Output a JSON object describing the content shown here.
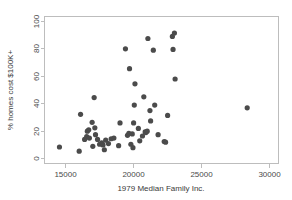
{
  "chart_data": {
    "type": "scatter",
    "title": "",
    "xlabel": "1979 Median Family Inc.",
    "ylabel": "% homes cost $100K+",
    "xlim": [
      13500,
      30700
    ],
    "ylim": [
      -4,
      103
    ],
    "xticks": [
      15000,
      20000,
      25000,
      30000
    ],
    "xtick_labels": [
      "15000",
      "20000",
      "25000",
      "30000"
    ],
    "yticks": [
      0,
      20,
      40,
      60,
      80,
      100
    ],
    "ytick_labels": [
      "0",
      "20",
      "40",
      "60",
      "80",
      "100"
    ],
    "grid": false,
    "legend": "none",
    "marker": "filled-circle",
    "marker_color": "#4b4b4b",
    "frame_color": "#bdbdbd",
    "points": [
      {
        "x": 14600,
        "y": 8.0
      },
      {
        "x": 16050,
        "y": 5.0
      },
      {
        "x": 16150,
        "y": 31.8
      },
      {
        "x": 16450,
        "y": 13.5
      },
      {
        "x": 16600,
        "y": 15.5
      },
      {
        "x": 16650,
        "y": 19.5
      },
      {
        "x": 16750,
        "y": 20.5
      },
      {
        "x": 16800,
        "y": 14.5
      },
      {
        "x": 17000,
        "y": 26.0
      },
      {
        "x": 17050,
        "y": 8.5
      },
      {
        "x": 17150,
        "y": 44.0
      },
      {
        "x": 17200,
        "y": 22.0
      },
      {
        "x": 17250,
        "y": 17.0
      },
      {
        "x": 17400,
        "y": 13.5
      },
      {
        "x": 17550,
        "y": 10.0
      },
      {
        "x": 17700,
        "y": 11.0
      },
      {
        "x": 17800,
        "y": 9.5
      },
      {
        "x": 17900,
        "y": 6.0
      },
      {
        "x": 18000,
        "y": 13.0
      },
      {
        "x": 18200,
        "y": 10.5
      },
      {
        "x": 18400,
        "y": 14.0
      },
      {
        "x": 18600,
        "y": 14.5
      },
      {
        "x": 18950,
        "y": 9.0
      },
      {
        "x": 19050,
        "y": 25.5
      },
      {
        "x": 19450,
        "y": 79.5
      },
      {
        "x": 19600,
        "y": 16.5
      },
      {
        "x": 19700,
        "y": 18.0
      },
      {
        "x": 19750,
        "y": 65.0
      },
      {
        "x": 19850,
        "y": 10.0
      },
      {
        "x": 19950,
        "y": 17.5
      },
      {
        "x": 20000,
        "y": 7.5
      },
      {
        "x": 20050,
        "y": 25.5
      },
      {
        "x": 20100,
        "y": 38.5
      },
      {
        "x": 20150,
        "y": 54.0
      },
      {
        "x": 20400,
        "y": 21.5
      },
      {
        "x": 20500,
        "y": 12.5
      },
      {
        "x": 20700,
        "y": 16.0
      },
      {
        "x": 20800,
        "y": 44.5
      },
      {
        "x": 20900,
        "y": 19.0
      },
      {
        "x": 20950,
        "y": 18.5
      },
      {
        "x": 21050,
        "y": 19.5
      },
      {
        "x": 21100,
        "y": 87.0
      },
      {
        "x": 21250,
        "y": 34.5
      },
      {
        "x": 21300,
        "y": 27.0
      },
      {
        "x": 21500,
        "y": 78.5
      },
      {
        "x": 21600,
        "y": 38.5
      },
      {
        "x": 21850,
        "y": 17.0
      },
      {
        "x": 22300,
        "y": 12.0
      },
      {
        "x": 22400,
        "y": 11.5
      },
      {
        "x": 22550,
        "y": 31.0
      },
      {
        "x": 22900,
        "y": 88.5
      },
      {
        "x": 22950,
        "y": 79.0
      },
      {
        "x": 23050,
        "y": 91.0
      },
      {
        "x": 23100,
        "y": 57.5
      },
      {
        "x": 28400,
        "y": 36.5
      }
    ]
  }
}
